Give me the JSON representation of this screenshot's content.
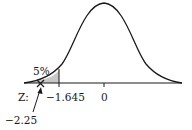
{
  "diagram": {
    "type": "normal-distribution",
    "labels": {
      "tail_percent": "5%",
      "axis_prefix": "Z:",
      "critical_value": "−1.645",
      "mean": "0",
      "test_statistic": "−2.25"
    },
    "colors": {
      "curve": "#1a1a1a",
      "shade": "#c8c8c8",
      "background": "#ffffff"
    }
  }
}
